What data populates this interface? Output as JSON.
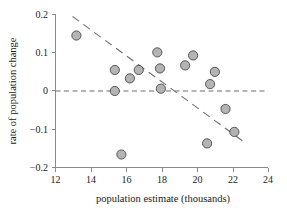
{
  "chart_data": {
    "type": "scatter",
    "title": "",
    "xlabel": "population estimate (thousands)",
    "ylabel": "rate of population change",
    "xlim": [
      12,
      24
    ],
    "ylim": [
      -0.2,
      0.2
    ],
    "xticks": [
      12,
      14,
      16,
      18,
      20,
      22,
      24
    ],
    "yticks": [
      0.2,
      0.1,
      0,
      -0.1,
      -0.2
    ],
    "xtick_labels": [
      "12",
      "14",
      "16",
      "18",
      "20",
      "22",
      "24"
    ],
    "ytick_labels": [
      "0.2",
      "0.1",
      "0",
      "−0.1",
      "−0.2"
    ],
    "grid": false,
    "legend": null,
    "points": [
      {
        "x": 13.18,
        "y": 0.145
      },
      {
        "x": 15.35,
        "y": 0.055
      },
      {
        "x": 15.35,
        "y": 0.0
      },
      {
        "x": 15.72,
        "y": -0.166
      },
      {
        "x": 16.2,
        "y": 0.033
      },
      {
        "x": 16.7,
        "y": 0.055
      },
      {
        "x": 17.75,
        "y": 0.101
      },
      {
        "x": 17.9,
        "y": 0.059
      },
      {
        "x": 17.95,
        "y": 0.006
      },
      {
        "x": 19.32,
        "y": 0.067
      },
      {
        "x": 19.77,
        "y": 0.093
      },
      {
        "x": 20.56,
        "y": -0.137
      },
      {
        "x": 20.73,
        "y": 0.018
      },
      {
        "x": 21.0,
        "y": 0.05
      },
      {
        "x": 21.6,
        "y": -0.047
      },
      {
        "x": 22.1,
        "y": -0.107
      }
    ],
    "zero_reference_line": {
      "y": 0.0,
      "style": "dashed",
      "x_from": 12,
      "x_to": 24
    },
    "trend_line": {
      "style": "dashed",
      "x_from": 12.96,
      "y_from": 0.195,
      "x_to": 22.55,
      "y_to": -0.13
    },
    "marker": {
      "shape": "circle",
      "fill_color": "#b4b4b4",
      "edge_color": "#4a4a4a",
      "radius_px": 4.6
    },
    "colors": {
      "axis": "#8a8a8a",
      "text": "#1a1a1a",
      "line": "#6e6e6e",
      "background": "#ffffff"
    }
  }
}
